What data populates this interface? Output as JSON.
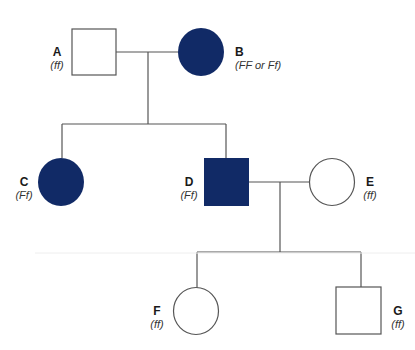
{
  "diagram": {
    "type": "pedigree",
    "colors": {
      "affected_fill": "#112a66",
      "unaffected_fill": "#ffffff",
      "line": "#555555",
      "background": "#ffffff"
    },
    "individuals": [
      {
        "id": "A",
        "sex": "male",
        "affected": false,
        "genotype": "(ff)",
        "generation": 1
      },
      {
        "id": "B",
        "sex": "female",
        "affected": true,
        "genotype": "(FF or Ff)",
        "generation": 1
      },
      {
        "id": "C",
        "sex": "female",
        "affected": true,
        "genotype": "(Ff)",
        "generation": 2
      },
      {
        "id": "D",
        "sex": "male",
        "affected": true,
        "genotype": "(Ff)",
        "generation": 2
      },
      {
        "id": "E",
        "sex": "female",
        "affected": false,
        "genotype": "(ff)",
        "generation": 2
      },
      {
        "id": "F",
        "sex": "female",
        "affected": false,
        "genotype": "(ff)",
        "generation": 3
      },
      {
        "id": "G",
        "sex": "male",
        "affected": false,
        "genotype": "(ff)",
        "generation": 3
      }
    ],
    "matings": [
      {
        "partners": [
          "A",
          "B"
        ],
        "children": [
          "C",
          "D"
        ]
      },
      {
        "partners": [
          "D",
          "E"
        ],
        "children": [
          "F",
          "G"
        ]
      }
    ]
  }
}
